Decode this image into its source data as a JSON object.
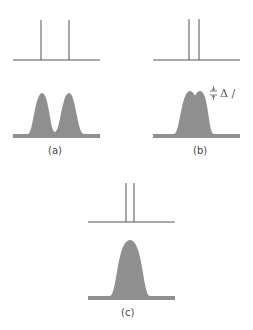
{
  "panels": [
    {
      "id": "a",
      "label": "(a)",
      "description": "two resolved lines; two well-separated peaks"
    },
    {
      "id": "b",
      "label": "(b)",
      "description": "closer lines; partially resolved peaks with dip",
      "annotation": "Δ /"
    },
    {
      "id": "c",
      "label": "(c)",
      "description": "very close lines; single unresolved peak"
    }
  ],
  "colors": {
    "line": "#555555",
    "peak_fill": "#8f8f8f",
    "background": "#ffffff"
  }
}
